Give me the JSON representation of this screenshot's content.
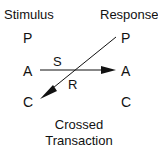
{
  "diagram": {
    "left_header": "Stimulus",
    "right_header": "Response",
    "left_states": [
      "P",
      "A",
      "C"
    ],
    "right_states": [
      "P",
      "A",
      "C"
    ],
    "arrows": [
      {
        "label": "S",
        "from": "left.A",
        "to": "right.A"
      },
      {
        "label": "R",
        "from": "right.P",
        "to": "left.C"
      }
    ],
    "caption_line1": "Crossed",
    "caption_line2": "Transaction"
  }
}
